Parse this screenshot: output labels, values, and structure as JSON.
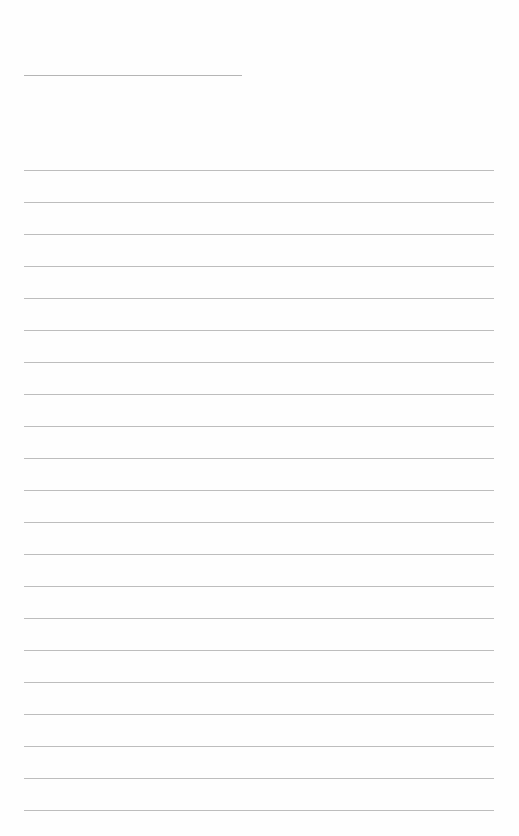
{
  "page": {
    "type": "blank lined sheet",
    "title_line": {
      "x": 24,
      "y": 75,
      "width": 218
    },
    "writing_lines": {
      "count": 21,
      "start_y": 170,
      "spacing": 32,
      "x": 24,
      "width": 470,
      "color": "#bdbdbd"
    }
  }
}
